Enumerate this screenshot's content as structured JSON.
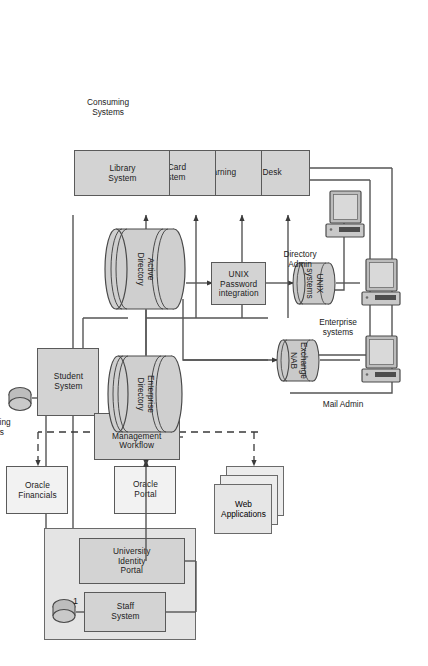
{
  "diagram": {
    "colors": {
      "node_fill": "#d3d3d3",
      "group_fill": "#e4e4e4",
      "stroke": "#5a5a5a",
      "line": "#555555",
      "background": "#ffffff"
    },
    "captions": [
      {
        "name": "consuming-systems-caption",
        "text": "Consuming\nSystems"
      },
      {
        "name": "provisioning-systems-caption",
        "text": "Provisioning\nSystems"
      },
      {
        "name": "directory-admin-caption",
        "text": "Directory\nAdmin"
      },
      {
        "name": "enterprise-systems-caption",
        "text": "Enterprise\nsystems"
      },
      {
        "name": "mail-admin-caption",
        "text": "Mail Admin"
      },
      {
        "name": "connector-number-1",
        "text": "1"
      }
    ],
    "nodes": {
      "library_system": "Library\nSystem",
      "id_card_system": "ID Card\nSystem",
      "elearning": "eLearning",
      "help_desk": "Help Desk",
      "student_system": "Student\nSystem",
      "identity_management_workflow": "Identity\nManagement\nWorkflow",
      "university_identity_portal": "University\nIdentity Portal",
      "staff_system": "Staff System",
      "active_directory": "Active\nDirectory",
      "enterprise_directory": "Enterprise\nDirectory",
      "unix_password_integration": "UNIX\nPassword\nintegration",
      "unix_systems": "UNIX\nsystems",
      "exchange_nab": "Exchange\nNAB",
      "web_applications": "Web\nApplications",
      "oracle_portal": "Oracle Portal",
      "oracle_financials": "Oracle\nFinancials"
    },
    "icons": {
      "directory_admin_pc": "computer-workstation-icon",
      "enterprise_systems_pc": "computer-workstation-icon",
      "mail_admin_pc": "computer-workstation-icon",
      "student_system_db": "database-disk-icon",
      "staff_system_db": "database-disk-icon"
    },
    "edges": [
      {
        "from": "Identity Management Workflow",
        "to": "Library System",
        "style": "solid"
      },
      {
        "from": "Identity Management Workflow",
        "to": "ID Card System",
        "style": "solid"
      },
      {
        "from": "Identity Management Workflow",
        "to": "eLearning",
        "style": "solid"
      },
      {
        "from": "Identity Management Workflow",
        "to": "Help Desk",
        "style": "solid"
      },
      {
        "from": "Identity Management Workflow",
        "to": "Enterprise Directory",
        "style": "solid"
      },
      {
        "from": "University Identity Portal",
        "to": "Identity Management Workflow",
        "style": "solid"
      },
      {
        "from": "Student System",
        "to": "Identity Management Workflow",
        "style": "solid"
      },
      {
        "from": "Active Directory",
        "to": "Enterprise Directory",
        "style": "solid"
      },
      {
        "from": "Active Directory",
        "to": "UNIX Password integration",
        "style": "solid"
      },
      {
        "from": "UNIX Password integration",
        "to": "UNIX systems",
        "style": "solid"
      },
      {
        "from": "Active Directory",
        "to": "Exchange NAB",
        "style": "solid"
      },
      {
        "from": "Enterprise Directory",
        "to": "Web Applications",
        "style": "dashed"
      },
      {
        "from": "Enterprise Directory",
        "to": "Oracle Portal",
        "style": "dashed"
      },
      {
        "from": "Enterprise Directory",
        "to": "Oracle Financials",
        "style": "dashed"
      },
      {
        "from": "Help Desk",
        "to": "Directory Admin",
        "style": "solid"
      },
      {
        "from": "Active Directory",
        "to": "Directory Admin",
        "style": "solid"
      },
      {
        "from": "UNIX systems",
        "to": "Enterprise systems",
        "style": "solid"
      },
      {
        "from": "Exchange NAB",
        "to": "Mail Admin",
        "style": "solid"
      },
      {
        "from": "Library System",
        "to": "Student System",
        "style": "solid"
      }
    ]
  }
}
